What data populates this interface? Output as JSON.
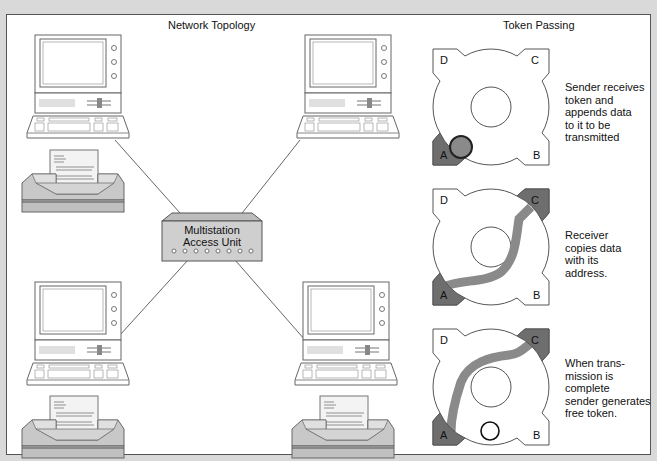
{
  "left_section": {
    "title": "Network Topology",
    "hub": {
      "line1": "Multistation",
      "line2": "Access Unit",
      "port_count": 8
    },
    "stations": [
      {
        "position": "top-left",
        "devices": [
          "computer-workstation",
          "printer"
        ]
      },
      {
        "position": "top-right",
        "devices": [
          "computer-workstation"
        ]
      },
      {
        "position": "bottom-left",
        "devices": [
          "computer-workstation",
          "printer"
        ]
      },
      {
        "position": "bottom-right",
        "devices": [
          "computer-workstation",
          "printer"
        ]
      }
    ]
  },
  "right_section": {
    "title": "Token Passing",
    "steps": [
      {
        "nodes": [
          "D",
          "C",
          "A",
          "B"
        ],
        "highlighted": [
          "A"
        ],
        "caption": "Sender receives\ntoken and\nappends data\nto it to be\ntransmitted"
      },
      {
        "nodes": [
          "D",
          "C",
          "A",
          "B"
        ],
        "highlighted": [
          "A",
          "C"
        ],
        "caption": "Receiver\ncopies data\nwith its\naddress."
      },
      {
        "nodes": [
          "D",
          "C",
          "A",
          "B"
        ],
        "highlighted": [
          "A",
          "C"
        ],
        "caption": "When trans-\nmission is\ncomplete\nsender generates\nfree token."
      }
    ]
  },
  "colors": {
    "highlight": "#6e6e6e",
    "path": "#8a8a8a",
    "line": "#555555",
    "frame": "#d9d9d9"
  }
}
